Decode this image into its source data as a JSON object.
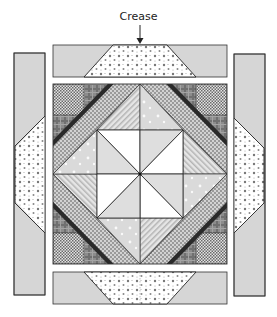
{
  "diagram": {
    "annotation": {
      "label": "Crease",
      "arrow": "down-arrow",
      "points_to": "top-strip-center"
    },
    "pieces": {
      "top_strip": {
        "fabric": "solid-light-gray",
        "inset": "polka-dot-trapezoid"
      },
      "bottom_strip": {
        "fabric": "solid-light-gray",
        "inset": "polka-dot-trapezoid"
      },
      "left_strip": {
        "fabric": "solid-light-gray",
        "inset": "polka-dot-hexagon"
      },
      "right_strip": {
        "fabric": "solid-light-gray",
        "inset": "polka-dot-hexagon"
      },
      "center_block": {
        "corner_squares": "fine-checker",
        "corner_triangles": "plaid",
        "frame_strip_outer": "solid-black",
        "frame_strip_inner": "dot-checker",
        "diamond_triangles": [
          "diagonal-stripe",
          "light-gray-dots"
        ],
        "pinwheel": [
          "white",
          "light-gray"
        ]
      }
    },
    "colors": {
      "outline": "#333333",
      "solid_gray": "#d6d6d6",
      "light_gray": "#dcdcdc",
      "dark": "#2a2a2a",
      "white": "#ffffff"
    }
  }
}
